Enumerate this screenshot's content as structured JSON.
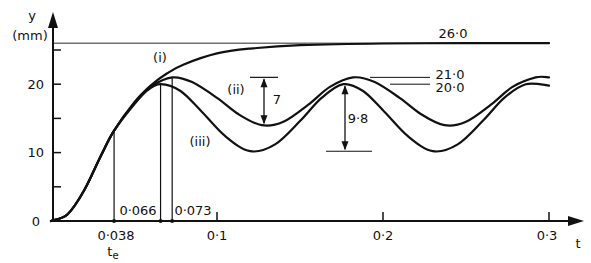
{
  "chart_data": {
    "type": "line",
    "title": "",
    "xlabel": "t",
    "ylabel": "y",
    "yunit": "(mm)",
    "xlim": [
      0,
      0.3
    ],
    "ylim": [
      0,
      26
    ],
    "grid": false,
    "legend": "inline labels",
    "x_ticks": [
      0.1,
      0.2,
      0.3
    ],
    "x_tick_labels": [
      "0·1",
      "0·2",
      "0·3"
    ],
    "y_ticks": [
      0,
      5,
      10,
      15,
      20,
      25
    ],
    "y_tick_labels": [
      "0",
      "",
      "10",
      "",
      "20",
      ""
    ],
    "series": [
      {
        "name": "(i)",
        "x": [
          0,
          0.01,
          0.02,
          0.03,
          0.038,
          0.05,
          0.06,
          0.07,
          0.08,
          0.1,
          0.12,
          0.15,
          0.2,
          0.25,
          0.3
        ],
        "y": [
          0,
          1.0,
          4.5,
          9.5,
          13.2,
          17.3,
          19.8,
          21.6,
          22.9,
          24.5,
          25.2,
          25.7,
          25.95,
          26.0,
          26.0
        ]
      },
      {
        "name": "(ii)",
        "x": [
          0,
          0.01,
          0.02,
          0.03,
          0.038,
          0.05,
          0.06,
          0.073,
          0.085,
          0.1,
          0.113,
          0.127,
          0.14,
          0.155,
          0.168,
          0.182,
          0.195,
          0.21,
          0.223,
          0.237,
          0.25,
          0.265,
          0.278,
          0.292,
          0.3
        ],
        "y": [
          0,
          1.0,
          4.5,
          9.5,
          13.2,
          17.2,
          19.6,
          21.0,
          20.3,
          18.0,
          15.6,
          14.0,
          14.5,
          17.0,
          19.6,
          21.0,
          20.3,
          18.0,
          15.6,
          14.0,
          14.5,
          17.0,
          19.6,
          21.0,
          21.0
        ]
      },
      {
        "name": "(iii)",
        "x": [
          0,
          0.01,
          0.02,
          0.03,
          0.038,
          0.05,
          0.058,
          0.066,
          0.078,
          0.09,
          0.105,
          0.12,
          0.135,
          0.15,
          0.163,
          0.176,
          0.188,
          0.2,
          0.215,
          0.23,
          0.245,
          0.26,
          0.273,
          0.286,
          0.3
        ],
        "y": [
          0,
          1.0,
          4.5,
          9.5,
          13.2,
          17.0,
          19.1,
          20.0,
          19.0,
          16.2,
          12.4,
          10.2,
          11.2,
          14.6,
          18.0,
          20.0,
          19.0,
          16.2,
          12.4,
          10.2,
          11.2,
          14.6,
          18.0,
          20.0,
          19.8
        ]
      }
    ],
    "annotations": [
      {
        "type": "hline",
        "y": 26.0,
        "label": "26·0"
      },
      {
        "type": "level",
        "y": 21.0,
        "label": "21·0"
      },
      {
        "type": "level",
        "y": 20.0,
        "label": "20·0"
      },
      {
        "type": "vline",
        "x": 0.038,
        "label": "0·038",
        "sublabel": "t",
        "subscript": "e"
      },
      {
        "type": "vline",
        "x": 0.066,
        "label": "0·066"
      },
      {
        "type": "vline",
        "x": 0.073,
        "label": "0·073"
      },
      {
        "type": "dimension",
        "label": "7",
        "from": 21.0,
        "to": 14.0,
        "x": 0.127
      },
      {
        "type": "dimension",
        "label": "9·8",
        "from": 20.0,
        "to": 10.2,
        "x": 0.176
      }
    ]
  },
  "labels": {
    "y_axis": "y",
    "y_unit": "(mm)",
    "x_axis": "t",
    "curve_i": "(i)",
    "curve_ii": "(ii)",
    "curve_iii": "(iii)",
    "val_26": "26·0",
    "val_21": "21·0",
    "val_20": "20·0",
    "amp_7": "7",
    "amp_98": "9·8",
    "t_038": "0·038",
    "t_066": "0·066",
    "t_073": "0·073",
    "te_main": "t",
    "te_sub": "e",
    "y0": "0",
    "y10": "10",
    "y20": "20",
    "x01": "0·1",
    "x02": "0·2",
    "x03": "0·3"
  }
}
